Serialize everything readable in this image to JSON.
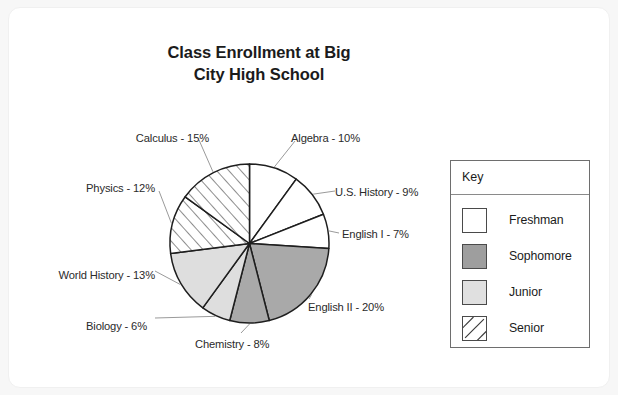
{
  "card": {
    "background": "#ffffff"
  },
  "chart_data": {
    "type": "pie",
    "title": "Class Enrollment at Big City High School",
    "title_line1": "Class Enrollment at Big",
    "title_line2": "City High School",
    "xlabel": "",
    "ylabel": "",
    "legend_position": "right",
    "grid": false,
    "units": "percent",
    "start_angle_deg": 0,
    "direction": "clockwise",
    "total": 100,
    "categories": [
      "Algebra",
      "U.S. History",
      "English I",
      "English II",
      "Chemistry",
      "Biology",
      "World History",
      "Physics",
      "Calculus"
    ],
    "values": [
      10,
      9,
      7,
      20,
      8,
      6,
      13,
      12,
      15
    ],
    "labels": [
      "Algebra - 10%",
      "U.S. History - 9%",
      "English I - 7%",
      "English II - 20%",
      "Chemistry - 8%",
      "Biology - 6%",
      "World History - 13%",
      "Physics - 12%",
      "Calculus - 15%"
    ],
    "slices": [
      {
        "name": "Algebra",
        "label": "Algebra - 10%",
        "value": 10,
        "group": "Freshman",
        "fill": "#ffffff",
        "pattern": "solid"
      },
      {
        "name": "U.S. History",
        "label": "U.S. History - 9%",
        "value": 9,
        "group": "Freshman",
        "fill": "#ffffff",
        "pattern": "solid"
      },
      {
        "name": "English I",
        "label": "English I - 7%",
        "value": 7,
        "group": "Freshman",
        "fill": "#ffffff",
        "pattern": "solid"
      },
      {
        "name": "English II",
        "label": "English II - 20%",
        "value": 20,
        "group": "Sophomore",
        "fill": "#a9a9a9",
        "pattern": "solid"
      },
      {
        "name": "Chemistry",
        "label": "Chemistry - 8%",
        "value": 8,
        "group": "Sophomore",
        "fill": "#a9a9a9",
        "pattern": "solid"
      },
      {
        "name": "Biology",
        "label": "Biology - 6%",
        "value": 6,
        "group": "Junior",
        "fill": "#dedede",
        "pattern": "solid"
      },
      {
        "name": "World History",
        "label": "World History - 13%",
        "value": 13,
        "group": "Junior",
        "fill": "#dedede",
        "pattern": "solid"
      },
      {
        "name": "Physics",
        "label": "Physics - 12%",
        "value": 12,
        "group": "Senior",
        "fill": "#ffffff",
        "pattern": "diagonal-hatch"
      },
      {
        "name": "Calculus",
        "label": "Calculus - 15%",
        "value": 15,
        "group": "Senior",
        "fill": "#ffffff",
        "pattern": "diagonal-hatch"
      }
    ],
    "legend": {
      "title": "Key",
      "entries": [
        {
          "label": "Freshman",
          "fill": "#ffffff",
          "pattern": "solid"
        },
        {
          "label": "Sophomore",
          "fill": "#9e9e9e",
          "pattern": "solid"
        },
        {
          "label": "Junior",
          "fill": "#e0e0e0",
          "pattern": "solid"
        },
        {
          "label": "Senior",
          "fill": "#ffffff",
          "pattern": "diagonal-hatch"
        }
      ]
    },
    "colors": {
      "freshman": "#ffffff",
      "sophomore": "#a9a9a9",
      "junior": "#dedede",
      "senior_hatch_line": "#3a3a3a",
      "outline": "#1e1e1e",
      "text": "#2b2b2b"
    }
  }
}
